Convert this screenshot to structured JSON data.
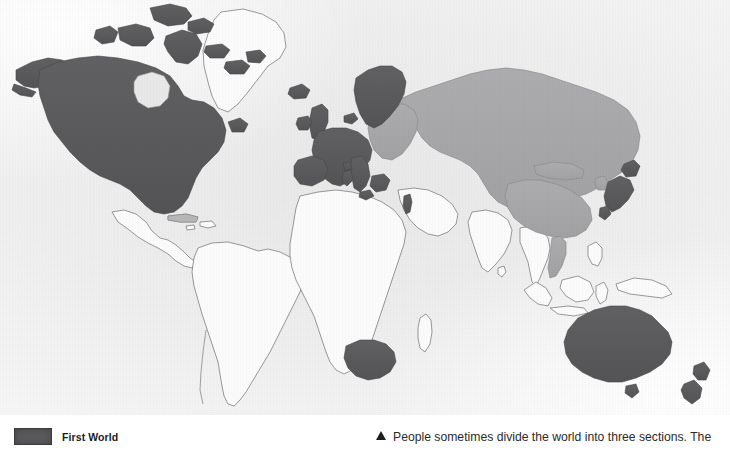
{
  "figure": {
    "kind": "world-map"
  },
  "legend": {
    "items": [
      {
        "label": "First World",
        "color": "#59595b"
      }
    ]
  },
  "caption": {
    "marker_icon": "triangle-up-icon",
    "text": "People sometimes divide the world into three sections. The"
  },
  "map_data": {
    "type": "choropleth",
    "projection": "world-mercator-ish",
    "categories": [
      {
        "name": "First World",
        "color": "#59595b"
      },
      {
        "name": "Second World",
        "color": "#a9a9ab"
      },
      {
        "name": "Third World",
        "color": "#fcfcfc"
      }
    ],
    "ocean_color": "#ededed",
    "border_color": "#6e6e6e",
    "regions_first_world": [
      "United States",
      "Canada",
      "Alaska",
      "Greenland archipelago islands",
      "Iceland",
      "United Kingdom",
      "Ireland",
      "Norway",
      "Sweden",
      "Finland",
      "Denmark",
      "Netherlands",
      "Belgium",
      "France",
      "Spain",
      "Portugal",
      "Italy",
      "Switzerland",
      "Austria",
      "West Germany",
      "Greece",
      "Sicily",
      "Sardinia",
      "Corsica",
      "Israel",
      "Japan",
      "South Africa",
      "Australia",
      "New Zealand"
    ],
    "regions_second_world": [
      "Soviet Union",
      "Poland",
      "East Germany",
      "Czechoslovakia",
      "Hungary",
      "Romania",
      "Bulgaria",
      "Yugoslavia",
      "Albania",
      "Mongolia",
      "China",
      "North Korea",
      "Vietnam",
      "Laos",
      "Cambodia",
      "Cuba"
    ],
    "regions_third_world": [
      "Mexico",
      "Central America",
      "South America",
      "Africa",
      "Greenland",
      "India",
      "Middle East",
      "Southeast Asia",
      "Indonesia",
      "Philippines",
      "Papua New Guinea"
    ]
  }
}
